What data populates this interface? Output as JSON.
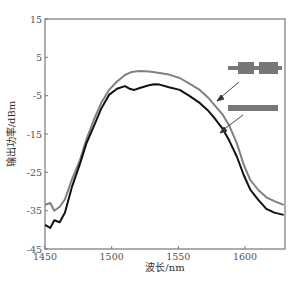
{
  "chart_data": {
    "type": "line",
    "title": "",
    "xlabel": "波长/nm",
    "ylabel": "输出功率/dBm",
    "xlim": [
      1450,
      1630
    ],
    "ylim": [
      -45,
      15
    ],
    "xticks": [
      1450,
      1500,
      1550,
      1600
    ],
    "yticks": [
      15,
      5,
      -5,
      -15,
      -25,
      -35,
      -45
    ],
    "grid": false,
    "legend": {
      "position": "upper right (inside plot, schematic waveguide icons with arrows)",
      "entries": [
        {
          "name": "segmented waveguide (two wide blocks)",
          "icon": "segmented-bar",
          "points_to": "gray curve"
        },
        {
          "name": "uniform waveguide (straight bar)",
          "icon": "uniform-bar",
          "points_to": "black curve"
        }
      ]
    },
    "series": [
      {
        "name": "segmented waveguide",
        "color": "#808080",
        "x": [
          1450,
          1454,
          1457,
          1461,
          1465,
          1470,
          1476,
          1481,
          1487,
          1492,
          1498,
          1504,
          1510,
          1515,
          1521,
          1528,
          1536,
          1543,
          1551,
          1558,
          1566,
          1572,
          1577,
          1583,
          1588,
          1594,
          1599,
          1604,
          1610,
          1616,
          1622,
          1629
        ],
        "y": [
          -33.5,
          -33.0,
          -35.0,
          -34.0,
          -32.0,
          -27.0,
          -22.0,
          -16.5,
          -11.0,
          -7.0,
          -3.5,
          -1.3,
          0.4,
          1.2,
          1.4,
          1.3,
          0.9,
          0.5,
          -0.4,
          -1.8,
          -3.5,
          -5.4,
          -7.4,
          -9.8,
          -12.7,
          -17.5,
          -23.0,
          -27.0,
          -29.6,
          -31.5,
          -32.5,
          -33.5
        ]
      },
      {
        "name": "uniform waveguide",
        "color": "#111111",
        "x": [
          1450,
          1454,
          1457,
          1461,
          1465,
          1470,
          1476,
          1481,
          1487,
          1492,
          1498,
          1504,
          1510,
          1514,
          1517,
          1521,
          1528,
          1532,
          1536,
          1543,
          1551,
          1558,
          1566,
          1572,
          1577,
          1583,
          1588,
          1594,
          1599,
          1604,
          1610,
          1616,
          1622,
          1629
        ],
        "y": [
          -38.7,
          -39.5,
          -37.5,
          -38.0,
          -35.5,
          -29.0,
          -23.0,
          -17.5,
          -12.7,
          -8.5,
          -4.8,
          -3.2,
          -2.5,
          -3.3,
          -3.5,
          -3.0,
          -2.3,
          -2.0,
          -2.1,
          -2.8,
          -3.5,
          -5.0,
          -6.9,
          -8.8,
          -10.8,
          -13.5,
          -16.6,
          -21.0,
          -25.7,
          -29.5,
          -32.2,
          -34.5,
          -35.5,
          -36.1
        ]
      }
    ]
  },
  "axes": {
    "xlabel": "波长/nm",
    "ylabel": "输出功率/dBm",
    "xtick_labels": [
      "1450",
      "1500",
      "1550",
      "1600"
    ],
    "ytick_labels": [
      "15",
      "5",
      "-5",
      "-15",
      "-25",
      "-35",
      "-45"
    ]
  }
}
